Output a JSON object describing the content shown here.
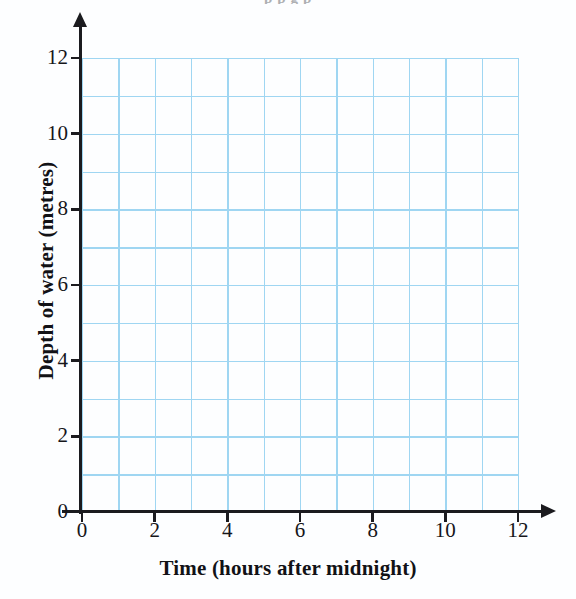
{
  "page": {
    "background_color": "#fdfeff",
    "cropped_heading_fragment": "p p g p"
  },
  "chart_data": {
    "type": "line",
    "title": "",
    "subtitle": "",
    "xlabel": "Time (hours after midnight)",
    "ylabel": "Depth of water (metres)",
    "xlim": [
      0,
      12
    ],
    "ylim": [
      0,
      12
    ],
    "x_major_ticks": [
      0,
      2,
      4,
      6,
      8,
      10,
      12
    ],
    "y_major_ticks": [
      0,
      2,
      4,
      6,
      8,
      10,
      12
    ],
    "x_tick_labels": [
      "0",
      "2",
      "4",
      "6",
      "8",
      "10",
      "12"
    ],
    "y_tick_labels": [
      "0",
      "2",
      "4",
      "6",
      "8",
      "10",
      "12"
    ],
    "x_gridlines": [
      0,
      1,
      2,
      3,
      4,
      5,
      6,
      7,
      8,
      9,
      10,
      11,
      12
    ],
    "y_gridlines": [
      0,
      1,
      2,
      3,
      4,
      5,
      6,
      7,
      8,
      9,
      10,
      11,
      12
    ],
    "grid": true,
    "grid_color": "#9fd6f2",
    "grid_interval": 1,
    "axis_color": "#1b1b1f",
    "legend": null,
    "legend_position": "none",
    "series": [],
    "annotations": [],
    "note": "Blank grid — empty axes provided for plotting; no data points or curves are drawn."
  },
  "axes": {
    "x_axis_name": "time-axis",
    "y_axis_name": "depth-axis",
    "x_arrow": true,
    "y_arrow": true
  }
}
